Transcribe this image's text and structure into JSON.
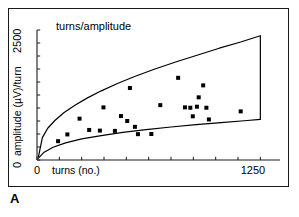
{
  "figure": {
    "panel_letter": "A",
    "background_color": "#ffffff",
    "frame_color": "#1a1a1a"
  },
  "chart_data": {
    "type": "scatter",
    "title": "turns/amplitude",
    "xlabel": "turns (no.)",
    "ylabel": "amplitude (µV)/turn",
    "xlim": [
      0,
      1360
    ],
    "ylim": [
      0,
      2500
    ],
    "x_tick_labels": [
      "0",
      "1250"
    ],
    "x_tick_label_values": [
      0,
      1250
    ],
    "y_tick_labels": [
      "0",
      "2500"
    ],
    "y_tick_label_values": [
      0,
      2500
    ],
    "x_minor_ticks": [
      0,
      125,
      250,
      375,
      500,
      625,
      750,
      875,
      1000,
      1125,
      1250
    ],
    "y_minor_ticks": [
      0,
      250,
      500,
      750,
      1000,
      1250,
      1500,
      1750,
      2000,
      2250,
      2500
    ],
    "grid": false,
    "legend": false,
    "marker": "square",
    "marker_color": "#000000",
    "marker_size_px": 4,
    "line_color": "#000000",
    "points": [
      {
        "x": 118,
        "y": 362
      },
      {
        "x": 170,
        "y": 492
      },
      {
        "x": 238,
        "y": 795
      },
      {
        "x": 292,
        "y": 578
      },
      {
        "x": 352,
        "y": 565
      },
      {
        "x": 372,
        "y": 1012
      },
      {
        "x": 436,
        "y": 560
      },
      {
        "x": 470,
        "y": 845
      },
      {
        "x": 505,
        "y": 750
      },
      {
        "x": 520,
        "y": 1385
      },
      {
        "x": 548,
        "y": 638
      },
      {
        "x": 565,
        "y": 497
      },
      {
        "x": 640,
        "y": 500
      },
      {
        "x": 690,
        "y": 1055
      },
      {
        "x": 790,
        "y": 1580
      },
      {
        "x": 828,
        "y": 1012
      },
      {
        "x": 858,
        "y": 1005
      },
      {
        "x": 872,
        "y": 840
      },
      {
        "x": 895,
        "y": 1025
      },
      {
        "x": 905,
        "y": 1205
      },
      {
        "x": 930,
        "y": 1435
      },
      {
        "x": 948,
        "y": 1005
      },
      {
        "x": 962,
        "y": 780
      },
      {
        "x": 1140,
        "y": 935
      }
    ],
    "envelope_upper": {
      "name": "upper bound",
      "x": [
        8,
        30,
        60,
        100,
        150,
        210,
        280,
        360,
        450,
        550,
        660,
        780,
        900,
        1020,
        1140,
        1250
      ],
      "y": [
        60,
        430,
        610,
        760,
        910,
        1050,
        1190,
        1330,
        1470,
        1610,
        1750,
        1890,
        2020,
        2150,
        2270,
        2390
      ]
    },
    "envelope_lower": {
      "name": "lower bound",
      "x": [
        8,
        40,
        90,
        160,
        250,
        360,
        480,
        610,
        750,
        890,
        1030,
        1160,
        1250
      ],
      "y": [
        35,
        150,
        245,
        330,
        405,
        470,
        530,
        585,
        635,
        680,
        720,
        755,
        780
      ]
    },
    "envelope_closing_edge": {
      "x": 1250,
      "y_top": 2390,
      "y_bottom": 780
    }
  }
}
